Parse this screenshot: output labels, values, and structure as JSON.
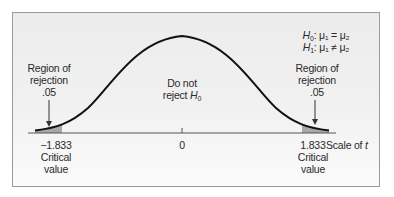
{
  "diagram": {
    "type": "t-distribution one-tailed/two-tailed rejection regions",
    "hypotheses": {
      "h0": {
        "symbol": "H",
        "sub": "0",
        "text": ": μ₁ = μ₂"
      },
      "h1": {
        "symbol": "H",
        "sub": "1",
        "text": ": μ₁ ≠ μ₂"
      }
    },
    "left_region": {
      "line1": "Region of",
      "line2": "rejection",
      "value": ".05"
    },
    "right_region": {
      "line1": "Region of",
      "line2": "rejection",
      "value": ".05"
    },
    "center_label": {
      "line1": "Do not",
      "line2_prefix": "reject ",
      "symbol": "H",
      "sub": "0"
    },
    "axis": {
      "ticks": [
        {
          "value": "−1.833",
          "caption1": "Critical",
          "caption2": "value"
        },
        {
          "value": "0"
        },
        {
          "value": "1.833",
          "caption1": "Critical",
          "caption2": "value"
        }
      ],
      "scale_label_prefix": "Scale of ",
      "scale_label_var": "t"
    },
    "colors": {
      "curve": "#111111",
      "shade": "#a8a8a8",
      "axis": "#555555",
      "frame_border": "#9a9a9a",
      "background": "#eeeeee"
    }
  }
}
